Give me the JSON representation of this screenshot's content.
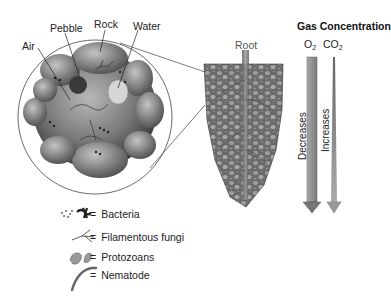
{
  "magnified_view": {
    "labels": {
      "air": "Air",
      "pebble": "Pebble",
      "rock": "Rock",
      "water": "Water"
    }
  },
  "root_view": {
    "label": "Root"
  },
  "gas_panel": {
    "title": "Gas Concentration",
    "gases": [
      {
        "base": "O",
        "sub": "2",
        "trend": "Decreases",
        "color": "#8a8a8a"
      },
      {
        "base": "CO",
        "sub": "2",
        "trend": "Increases",
        "color": "#9a9a9a"
      }
    ]
  },
  "legend": {
    "equals": "=",
    "items": [
      {
        "icon": "bacteria-icon",
        "label": "Bacteria"
      },
      {
        "icon": "fungi-icon",
        "label": "Filamentous fungi"
      },
      {
        "icon": "protozoa-icon",
        "label": "Protozoans"
      },
      {
        "icon": "nematode-icon",
        "label": "Nematode"
      }
    ]
  }
}
